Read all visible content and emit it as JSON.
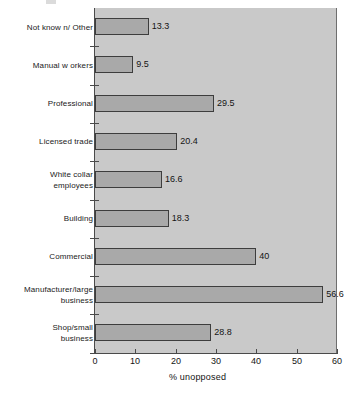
{
  "chart_data": {
    "type": "bar",
    "orientation": "horizontal",
    "title": "",
    "xlabel": "% unopposed",
    "ylabel": "",
    "xlim": [
      0,
      60
    ],
    "xticks": [
      0,
      10,
      20,
      30,
      40,
      50,
      60
    ],
    "grid": false,
    "legend": null,
    "categories": [
      "Not known/ Other",
      "Manual workers",
      "Professional",
      "Licensed trade",
      "White collar employees",
      "Building",
      "Commercial",
      "Manufacturer/large business",
      "Shop/small business"
    ],
    "values": [
      13.3,
      9.5,
      29.5,
      20.4,
      16.6,
      18.3,
      40,
      56.6,
      28.8
    ],
    "value_labels": [
      "13.3",
      "9.5",
      "29.5",
      "20.4",
      "16.6",
      "18.3",
      "40",
      "56.6",
      "28.8"
    ],
    "category_lines": [
      [
        "Not know n/ Other"
      ],
      [
        "Manual w orkers"
      ],
      [
        "Professional"
      ],
      [
        "Licensed trade"
      ],
      [
        "White collar",
        "employees"
      ],
      [
        "Building"
      ],
      [
        "Commercial"
      ],
      [
        "Manufacturer/large",
        "business"
      ],
      [
        "Shop/small",
        "business"
      ]
    ],
    "colors": {
      "bar_fill": "#a9a9a9",
      "bar_border": "#3d3d3d",
      "panel_background": "#c9c9c9",
      "axis": "#4a4a4a",
      "text": "#141414",
      "page_background": "#ffffff"
    }
  }
}
